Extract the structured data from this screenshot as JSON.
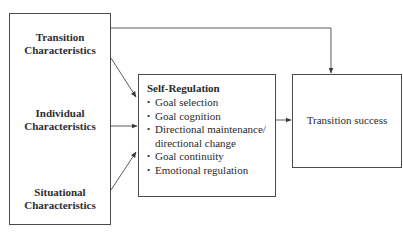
{
  "diagram": {
    "factors": [
      {
        "line1": "Transition",
        "line2": "Characteristics"
      },
      {
        "line1": "Individual",
        "line2": "Characteristics"
      },
      {
        "line1": "Situational",
        "line2": "Characteristics"
      }
    ],
    "self_regulation": {
      "title": "Self-Regulation",
      "bullet": "•",
      "items": [
        "Goal selection",
        "Goal cognition",
        "Directional maintenance/ directional change",
        "Goal continuity",
        "Emotional regulation"
      ]
    },
    "outcome": {
      "label": "Transition success"
    },
    "edges": [
      {
        "from": "Transition Characteristics",
        "to": "Transition success"
      },
      {
        "from": "Transition Characteristics",
        "to": "Self-Regulation"
      },
      {
        "from": "Individual Characteristics",
        "to": "Self-Regulation"
      },
      {
        "from": "Situational Characteristics",
        "to": "Self-Regulation"
      },
      {
        "from": "Self-Regulation",
        "to": "Transition success"
      }
    ],
    "colors": {
      "line": "#4a4a4a",
      "text": "#2a2a2a",
      "background": "#ffffff"
    }
  }
}
